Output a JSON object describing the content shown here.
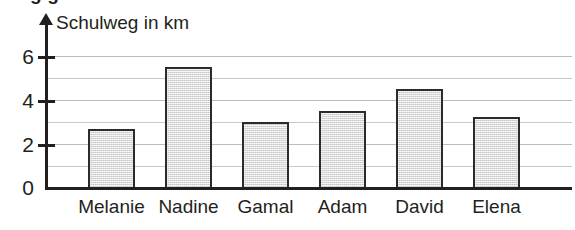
{
  "cropped_headline_above": "g                                        g",
  "axis_title": "Schulweg in km",
  "y_tick_labels": [
    "0",
    "2",
    "4",
    "6"
  ],
  "chart_data": {
    "type": "bar",
    "title": "",
    "xlabel": "",
    "ylabel": "Schulweg in km",
    "categories": [
      "Melanie",
      "Nadine",
      "Gamal",
      "Adam",
      "David",
      "Elena"
    ],
    "values": [
      2.7,
      5.5,
      3.0,
      3.5,
      4.5,
      3.25
    ],
    "ylim": [
      0,
      6.6
    ],
    "y_major_ticks": [
      0,
      2,
      4,
      6
    ],
    "y_minor_gridlines": [
      1,
      3,
      5
    ],
    "grid": true,
    "legend": null,
    "bar_fill_color": "#e3e3e3",
    "bar_border_color": "#2b2b2b",
    "gridline_color": "#c9c9c9",
    "axis_color": "#231f20"
  }
}
